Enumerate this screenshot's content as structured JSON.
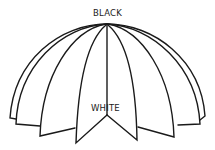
{
  "labels": {
    "top": "BLACK",
    "bottom": "WHITE"
  },
  "colors": {
    "stroke": "#1a1a1a",
    "background": "#ffffff"
  },
  "diagram": {
    "petal_count": 8
  }
}
